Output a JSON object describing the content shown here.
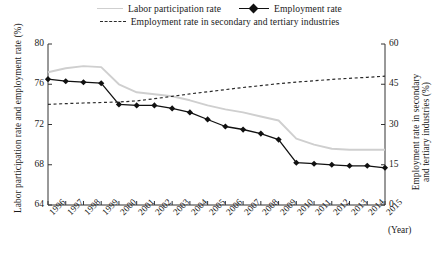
{
  "legend": {
    "items": [
      {
        "label": "Labor participation rate",
        "style": "solid-gray",
        "color": "#cfcfcf"
      },
      {
        "label": "Employment rate",
        "style": "solid-marker",
        "color": "#111111"
      },
      {
        "label": "Employment rate in secondary and tertiary industries",
        "style": "dashed",
        "color": "#2a2a2a"
      }
    ]
  },
  "axes": {
    "left_title": "Labor participation rate and employment rate (%)",
    "right_title_line1": "Employment rate in secondary",
    "right_title_line2": "and tertiary industries (%)",
    "x_unit": "(Year)",
    "left_ticks": [
      "80",
      "76",
      "72",
      "68",
      "64"
    ],
    "right_ticks": [
      "60",
      "45",
      "30",
      "15",
      "0"
    ]
  },
  "chart_data": {
    "type": "line",
    "title": "",
    "xlabel": "(Year)",
    "ylabel": "Labor participation rate and employment rate (%)",
    "y2label": "Employment rate in secondary and tertiary industries (%)",
    "ylim": [
      64,
      80
    ],
    "y2lim": [
      0,
      60
    ],
    "grid": false,
    "legend_position": "top",
    "categories": [
      "1996",
      "1997",
      "1998",
      "1999",
      "2000",
      "2001",
      "2002",
      "2003",
      "2004",
      "2005",
      "2006",
      "2007",
      "2008",
      "2009",
      "2010",
      "2011",
      "2012",
      "2013",
      "2014",
      "2015"
    ],
    "series": [
      {
        "name": "Labor participation rate",
        "axis": "left",
        "style": "solid",
        "color": "#cfcfcf",
        "markers": false,
        "values": [
          77.2,
          77.6,
          77.8,
          77.7,
          76.0,
          75.2,
          75.0,
          74.8,
          74.4,
          73.9,
          73.5,
          73.2,
          72.8,
          72.4,
          70.6,
          70.0,
          69.6,
          69.5,
          69.5,
          69.5
        ]
      },
      {
        "name": "Employment rate",
        "axis": "left",
        "style": "solid",
        "color": "#111111",
        "markers": true,
        "values": [
          76.5,
          76.3,
          76.2,
          76.1,
          74.0,
          73.9,
          73.9,
          73.6,
          73.2,
          72.5,
          71.8,
          71.5,
          71.1,
          70.5,
          68.2,
          68.1,
          68.0,
          67.9,
          67.9,
          67.7
        ]
      },
      {
        "name": "Employment rate in secondary and tertiary industries",
        "axis": "right",
        "style": "dashed",
        "color": "#2a2a2a",
        "markers": false,
        "values": [
          37.5,
          37.8,
          38.0,
          38.2,
          38.4,
          38.8,
          39.6,
          40.5,
          41.4,
          42.2,
          43.0,
          43.8,
          44.5,
          45.2,
          45.8,
          46.3,
          46.8,
          47.2,
          47.6,
          48.0
        ]
      }
    ]
  }
}
